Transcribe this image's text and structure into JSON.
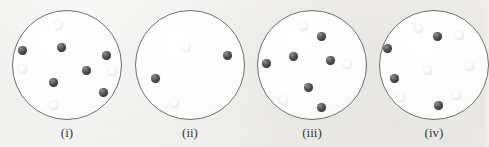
{
  "figure": {
    "background_color": "#eeedea",
    "width": 485,
    "height": 147
  },
  "colors": {
    "dark_sphere": "#3b3b3b",
    "light_sphere": "#f2f0ec",
    "circle_outline": "#6e6e6e",
    "circle_fill": "#ffffff",
    "label_text": "#3a3a3a"
  },
  "panels": [
    {
      "id": "panel-i",
      "label": "(i)",
      "label_x": 67,
      "label_y": 125,
      "circle": {
        "cx": 67,
        "cy": 65,
        "r": 55
      },
      "counts": {
        "dark": 6,
        "light": 4,
        "total": 10
      },
      "spheres": [
        {
          "type": "light",
          "x": 58,
          "y": 25,
          "d": 9
        },
        {
          "type": "dark",
          "x": 61,
          "y": 47,
          "d": 9
        },
        {
          "type": "dark",
          "x": 22,
          "y": 50,
          "d": 9
        },
        {
          "type": "dark",
          "x": 106,
          "y": 55,
          "d": 9
        },
        {
          "type": "dark",
          "x": 86,
          "y": 70,
          "d": 9
        },
        {
          "type": "light",
          "x": 22,
          "y": 69,
          "d": 9
        },
        {
          "type": "light",
          "x": 112,
          "y": 71,
          "d": 9
        },
        {
          "type": "dark",
          "x": 53,
          "y": 82,
          "d": 9
        },
        {
          "type": "dark",
          "x": 103,
          "y": 92,
          "d": 9
        },
        {
          "type": "light",
          "x": 53,
          "y": 105,
          "d": 9
        }
      ]
    },
    {
      "id": "panel-ii",
      "label": "(ii)",
      "label_x": 190,
      "label_y": 125,
      "circle": {
        "cx": 190,
        "cy": 65,
        "r": 55
      },
      "counts": {
        "dark": 2,
        "light": 2,
        "total": 4
      },
      "spheres": [
        {
          "type": "light",
          "x": 186,
          "y": 47,
          "d": 9
        },
        {
          "type": "dark",
          "x": 227,
          "y": 55,
          "d": 9
        },
        {
          "type": "dark",
          "x": 155,
          "y": 78,
          "d": 9
        },
        {
          "type": "light",
          "x": 174,
          "y": 103,
          "d": 9
        }
      ]
    },
    {
      "id": "panel-iii",
      "label": "(iii)",
      "label_x": 312,
      "label_y": 125,
      "circle": {
        "cx": 312,
        "cy": 65,
        "r": 55
      },
      "counts": {
        "dark": 6,
        "light": 3,
        "total": 9
      },
      "spheres": [
        {
          "type": "light",
          "x": 303,
          "y": 26,
          "d": 9
        },
        {
          "type": "dark",
          "x": 321,
          "y": 36,
          "d": 9
        },
        {
          "type": "dark",
          "x": 293,
          "y": 56,
          "d": 9
        },
        {
          "type": "dark",
          "x": 266,
          "y": 63,
          "d": 9
        },
        {
          "type": "dark",
          "x": 330,
          "y": 60,
          "d": 9
        },
        {
          "type": "light",
          "x": 347,
          "y": 64,
          "d": 9
        },
        {
          "type": "dark",
          "x": 308,
          "y": 87,
          "d": 9
        },
        {
          "type": "light",
          "x": 283,
          "y": 100,
          "d": 9
        },
        {
          "type": "dark",
          "x": 321,
          "y": 107,
          "d": 9
        }
      ]
    },
    {
      "id": "panel-iv",
      "label": "(iv)",
      "label_x": 434,
      "label_y": 125,
      "circle": {
        "cx": 434,
        "cy": 65,
        "r": 55
      },
      "counts": {
        "dark": 4,
        "light": 6,
        "total": 10
      },
      "spheres": [
        {
          "type": "light",
          "x": 418,
          "y": 28,
          "d": 9
        },
        {
          "type": "dark",
          "x": 437,
          "y": 36,
          "d": 9
        },
        {
          "type": "light",
          "x": 459,
          "y": 35,
          "d": 9
        },
        {
          "type": "dark",
          "x": 387,
          "y": 48,
          "d": 9
        },
        {
          "type": "light",
          "x": 469,
          "y": 66,
          "d": 9
        },
        {
          "type": "light",
          "x": 427,
          "y": 70,
          "d": 9
        },
        {
          "type": "dark",
          "x": 394,
          "y": 78,
          "d": 9
        },
        {
          "type": "light",
          "x": 400,
          "y": 97,
          "d": 9
        },
        {
          "type": "light",
          "x": 456,
          "y": 95,
          "d": 9
        },
        {
          "type": "dark",
          "x": 438,
          "y": 105,
          "d": 9
        }
      ]
    }
  ]
}
